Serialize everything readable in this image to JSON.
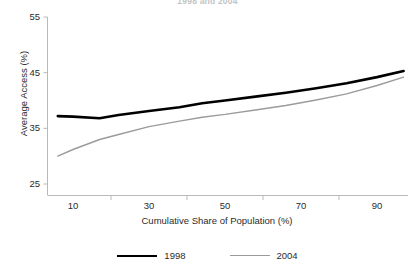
{
  "chart_data": {
    "type": "line",
    "title": "1998 and 2004",
    "xlabel": "Cumulative Share of Population (%)",
    "ylabel": "Average Access (%)",
    "xlim": [
      5,
      98
    ],
    "ylim": [
      25,
      55
    ],
    "xticks": [
      10,
      30,
      50,
      70,
      90
    ],
    "yticks": [
      25,
      35,
      45,
      55
    ],
    "grid": false,
    "legend_position": "bottom",
    "x": [
      6,
      10,
      17,
      22,
      30,
      38,
      44,
      50,
      58,
      66,
      74,
      82,
      90,
      97
    ],
    "series": [
      {
        "name": "1998",
        "color": "#000000",
        "values": [
          37.2,
          37.1,
          36.8,
          37.4,
          38.1,
          38.8,
          39.5,
          40.0,
          40.7,
          41.4,
          42.2,
          43.1,
          44.2,
          45.3
        ]
      },
      {
        "name": "2004",
        "color": "#9b9b9b",
        "values": [
          30.0,
          31.2,
          33.0,
          33.9,
          35.3,
          36.3,
          37.0,
          37.5,
          38.3,
          39.1,
          40.1,
          41.2,
          42.7,
          44.2
        ]
      }
    ]
  },
  "axes": {
    "y_tick_labels": [
      "55",
      "45",
      "35",
      "25"
    ],
    "x_tick_labels": [
      "10",
      "30",
      "50",
      "70",
      "90"
    ],
    "y_axis_title": "Average Access (%)",
    "x_axis_title": "Cumulative Share of Population (%)"
  },
  "legend": {
    "entries": [
      {
        "label": "1998"
      },
      {
        "label": "2004"
      }
    ]
  },
  "title": "1998 and 2004",
  "colors": {
    "series_1998": "#000000",
    "series_2004": "#9b9b9b",
    "axis": "#b9b9b9",
    "text": "#231f20"
  }
}
